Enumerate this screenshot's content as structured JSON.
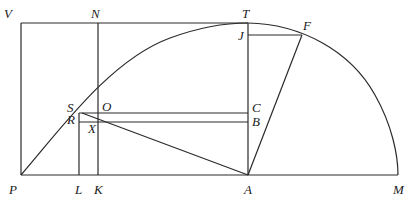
{
  "diagram": {
    "type": "geometric-construction",
    "labels": {
      "V": "V",
      "N": "N",
      "T": "T",
      "F": "F",
      "J": "J",
      "S": "S",
      "O": "O",
      "R": "R",
      "X": "X",
      "C": "C",
      "B": "B",
      "P": "P",
      "L": "L",
      "K": "K",
      "A": "A",
      "M": "M"
    },
    "points": {
      "V": [
        21,
        23
      ],
      "N": [
        98,
        23
      ],
      "T": [
        248,
        23
      ],
      "J": [
        248,
        35
      ],
      "F": [
        302,
        35
      ],
      "S": [
        79,
        113
      ],
      "O": [
        98,
        110
      ],
      "R": [
        79,
        122
      ],
      "X": [
        98,
        122
      ],
      "C": [
        248,
        113
      ],
      "B": [
        248,
        122
      ],
      "P": [
        21,
        175
      ],
      "L": [
        79,
        175
      ],
      "K": [
        98,
        175
      ],
      "A": [
        248,
        175
      ],
      "M": [
        398,
        175
      ]
    },
    "stroke_color": "#2a2a2a"
  }
}
